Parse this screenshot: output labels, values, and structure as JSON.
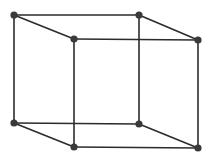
{
  "diagram": {
    "type": "wireframe-cube",
    "colors": {
      "edge": "#2b2b2b",
      "vertex": "#3a3a3a",
      "background": "#ffffff"
    },
    "edge_width": 1.6,
    "vertex_radius": 3.6,
    "vertices": [
      {
        "id": "back-top-left",
        "x": 14,
        "y": 15
      },
      {
        "id": "back-top-right",
        "x": 139,
        "y": 15
      },
      {
        "id": "front-top-left",
        "x": 74,
        "y": 39
      },
      {
        "id": "front-top-right",
        "x": 198,
        "y": 40
      },
      {
        "id": "back-bottom-left",
        "x": 14,
        "y": 123
      },
      {
        "id": "back-bottom-right",
        "x": 139,
        "y": 124
      },
      {
        "id": "front-bottom-left",
        "x": 74,
        "y": 147
      },
      {
        "id": "front-bottom-right",
        "x": 198,
        "y": 148
      }
    ],
    "edges": [
      [
        "back-top-left",
        "back-top-right"
      ],
      [
        "back-top-left",
        "front-top-left"
      ],
      [
        "back-top-right",
        "front-top-right"
      ],
      [
        "front-top-left",
        "front-top-right"
      ],
      [
        "back-bottom-left",
        "back-bottom-right"
      ],
      [
        "back-bottom-left",
        "front-bottom-left"
      ],
      [
        "back-bottom-right",
        "front-bottom-right"
      ],
      [
        "front-bottom-left",
        "front-bottom-right"
      ],
      [
        "back-top-left",
        "back-bottom-left"
      ],
      [
        "back-top-right",
        "back-bottom-right"
      ],
      [
        "front-top-left",
        "front-bottom-left"
      ],
      [
        "front-top-right",
        "front-bottom-right"
      ]
    ]
  }
}
